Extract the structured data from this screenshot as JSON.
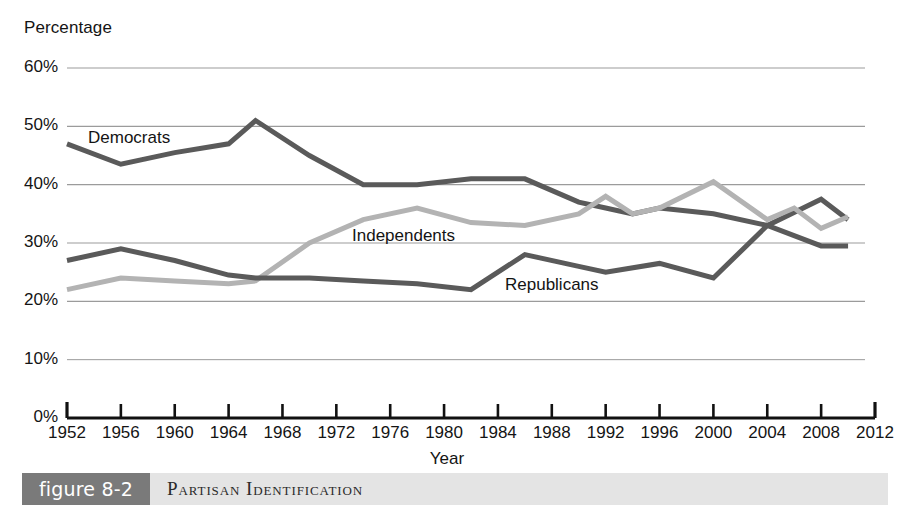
{
  "chart_data": {
    "type": "line",
    "title": "Partisan Identification",
    "xlabel": "Year",
    "ylabel": "Percentage",
    "xlim": [
      1952,
      2012
    ],
    "ylim": [
      0,
      60
    ],
    "grid": true,
    "legend_position": "inline-labels",
    "x_ticks": [
      "1952",
      "1956",
      "1960",
      "1964",
      "1968",
      "1972",
      "1976",
      "1980",
      "1984",
      "1988",
      "1992",
      "1996",
      "2000",
      "2004",
      "2008",
      "2012"
    ],
    "y_ticks": [
      "0%",
      "10%",
      "20%",
      "30%",
      "40%",
      "50%",
      "60%"
    ],
    "series": [
      {
        "name": "Democrats",
        "color": "#5a5a5a",
        "x": [
          1952,
          1956,
          1960,
          1964,
          1966,
          1970,
          1974,
          1978,
          1982,
          1986,
          1990,
          1992,
          1994,
          1996,
          2000,
          2004,
          2008,
          2010
        ],
        "values": [
          47,
          43.5,
          45.5,
          47,
          51,
          45,
          40,
          40,
          41,
          41,
          37,
          36,
          35,
          36,
          35,
          33,
          37.5,
          34
        ]
      },
      {
        "name": "Independents",
        "color": "#b3b3b3",
        "x": [
          1952,
          1956,
          1960,
          1964,
          1966,
          1970,
          1974,
          1978,
          1982,
          1986,
          1990,
          1992,
          1994,
          1996,
          2000,
          2004,
          2006,
          2008,
          2010
        ],
        "values": [
          22,
          24,
          23.5,
          23,
          23.5,
          30,
          34,
          36,
          33.5,
          33,
          35,
          38,
          35,
          36,
          40.5,
          34,
          36,
          32.5,
          34.5
        ]
      },
      {
        "name": "Republicans",
        "color": "#5a5a5a",
        "x": [
          1952,
          1956,
          1960,
          1964,
          1966,
          1970,
          1974,
          1978,
          1982,
          1986,
          1990,
          1992,
          1996,
          2000,
          2004,
          2008,
          2010
        ],
        "values": [
          27,
          29,
          27,
          24.5,
          24,
          24,
          23.5,
          23,
          22,
          28,
          26,
          25,
          26.5,
          24,
          33,
          29.5,
          29.5
        ]
      }
    ],
    "series_inline_labels": [
      {
        "name": "Democrats",
        "label": "Democrats"
      },
      {
        "name": "Independents",
        "label": "Independents"
      },
      {
        "name": "Republicans",
        "label": "Republicans"
      }
    ]
  },
  "axes": {
    "y_title": "Percentage",
    "x_title": "Year",
    "y_tick_labels": [
      "60%",
      "50%",
      "40%",
      "30%",
      "20%",
      "10%",
      "0%"
    ],
    "x_tick_labels": [
      "1952",
      "1956",
      "1960",
      "1964",
      "1968",
      "1972",
      "1976",
      "1980",
      "1984",
      "1988",
      "1992",
      "1996",
      "2000",
      "2004",
      "2008",
      "2012"
    ]
  },
  "labels": {
    "democrats": "Democrats",
    "independents": "Independents",
    "republicans": "Republicans"
  },
  "caption": {
    "tag": "figure 8-2",
    "title": "Partisan Identification"
  },
  "colors": {
    "dark_line": "#5a5a5a",
    "light_line": "#b3b3b3",
    "grid": "#9b9b9b",
    "axis": "#111111",
    "caption_tag_bg": "#7a7a7a",
    "caption_bar_bg": "#e4e4e4"
  }
}
